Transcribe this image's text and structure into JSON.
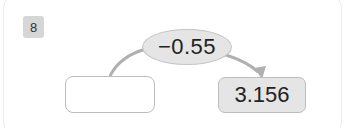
{
  "problem": {
    "number": "8",
    "operation": "−0.55",
    "input_value": "",
    "output_value": "3.156"
  },
  "colors": {
    "badge_bg": "#d6d6d6",
    "operation_bg": "#e5e5e5",
    "result_bg": "#e5e5e5",
    "connector": "#b0b0b0"
  }
}
